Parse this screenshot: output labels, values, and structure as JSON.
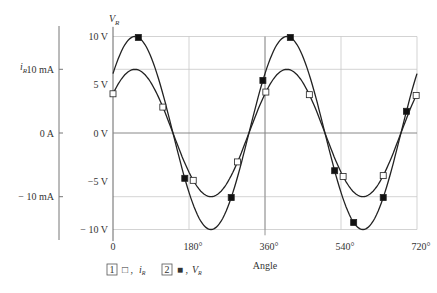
{
  "chart_data": {
    "type": "line",
    "title": "",
    "xlabel": "Angle",
    "x_ticks": [
      "0",
      "180°",
      "360°",
      "540°",
      "720°"
    ],
    "x_range": [
      0,
      720
    ],
    "left_axis": {
      "label": "iR",
      "ticks": [
        "10 mA",
        "0 A",
        "− 10 mA"
      ],
      "tick_values_mA": [
        10,
        0,
        -10
      ]
    },
    "right_axis": {
      "label": "VR",
      "ticks": [
        "10 V",
        "5 V",
        "0 V",
        "−5 V",
        "− 10 V"
      ],
      "tick_values_V": [
        10,
        5,
        0,
        -5,
        -10
      ],
      "ylim": [
        -10,
        10
      ]
    },
    "grid": true,
    "series": [
      {
        "name": "iR",
        "marker": "hollow-square",
        "legend_index": "1",
        "amplitude_mA": 10,
        "amplitude_display_V": 6.6,
        "phase_deg": 38,
        "x": [
          0,
          120,
          180,
          300,
          360,
          480,
          540,
          660,
          720
        ],
        "values_mA": [
          6.2,
          3.6,
          -6.2,
          -3.6,
          6.2,
          3.6,
          -6.2,
          -3.6,
          6.2
        ]
      },
      {
        "name": "VR",
        "marker": "filled-square",
        "legend_index": "2",
        "amplitude_V": 10,
        "phase_deg": 38,
        "x": [
          60,
          170,
          280,
          355,
          420,
          525,
          570,
          640,
          695
        ],
        "values": [
          9.4,
          -4.6,
          -8.2,
          5.8,
          6.7,
          -8.5,
          -9.9,
          -3.9,
          0.9
        ]
      }
    ],
    "legend": [
      {
        "index": "1",
        "symbol": "□",
        "label": "iR"
      },
      {
        "index": "2",
        "symbol": "■",
        "label": "VR"
      }
    ]
  },
  "labels": {
    "left_axis_title": "i",
    "left_axis_sub": "R",
    "right_axis_title": "V",
    "right_axis_sub": "R",
    "x_axis_title": "Angle",
    "legend1_index": "1",
    "legend1_symbol": "□ ,",
    "legend1_name": "i",
    "legend1_sub": "R",
    "legend2_index": "2",
    "legend2_symbol": "■ ,",
    "legend2_name": "V",
    "legend2_sub": "R"
  }
}
